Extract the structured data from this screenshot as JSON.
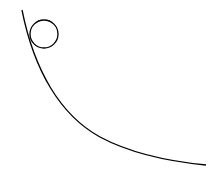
{
  "diagram": {
    "background": "#ffffff",
    "stroke_color": "#000000",
    "ramp": {
      "start": [
        22,
        10
      ],
      "end": [
        206,
        165
      ]
    },
    "ball": {
      "cx": 44,
      "cy": 34,
      "r": 14
    }
  }
}
